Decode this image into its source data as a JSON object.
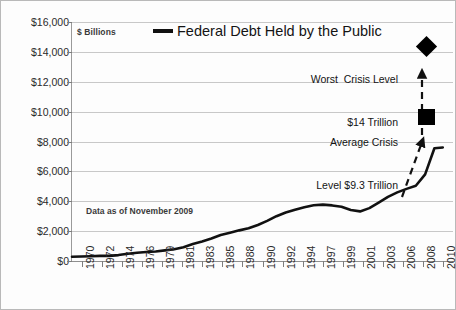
{
  "chart_data": {
    "type": "line",
    "title": "Federal Debt Held by the Public",
    "units_label": "$ Billions",
    "note": "Data as of November 2009",
    "xlabel": "",
    "ylabel": "",
    "ylim": [
      0,
      16000
    ],
    "xlim": [
      1970,
      2011
    ],
    "grid": true,
    "legend_position": "top-center",
    "ytick_labels": [
      "$0",
      "$2,000",
      "$4,000",
      "$6,000",
      "$8,000",
      "$10,000",
      "$12,000",
      "$14,000",
      "$16,000"
    ],
    "ytick_values": [
      0,
      2000,
      4000,
      6000,
      8000,
      10000,
      12000,
      14000,
      16000
    ],
    "xtick_labels": [
      "1970",
      "1972",
      "1974",
      "1976",
      "1979",
      "1981",
      "1983",
      "1985",
      "1988",
      "1990",
      "1992",
      "1994",
      "1997",
      "1999",
      "2001",
      "2003",
      "2006",
      "2008",
      "2010"
    ],
    "series": [
      {
        "name": "Federal Debt Held by the Public",
        "color": "#111111",
        "x": [
          1970,
          1971,
          1972,
          1973,
          1974,
          1975,
          1976,
          1977,
          1978,
          1979,
          1980,
          1981,
          1982,
          1983,
          1984,
          1985,
          1986,
          1987,
          1988,
          1989,
          1990,
          1991,
          1992,
          1993,
          1994,
          1995,
          1996,
          1997,
          1998,
          1999,
          2000,
          2001,
          2002,
          2003,
          2004,
          2005,
          2006,
          2007,
          2008,
          2009,
          2009.9
        ],
        "values": [
          283,
          303,
          322,
          343,
          346,
          396,
          480,
          551,
          607,
          640,
          712,
          789,
          925,
          1137,
          1307,
          1507,
          1741,
          1890,
          2051,
          2190,
          2412,
          2689,
          2999,
          3248,
          3433,
          3604,
          3734,
          3772,
          3721,
          3632,
          3410,
          3320,
          3540,
          3913,
          4296,
          4592,
          4829,
          5035,
          5803,
          7552,
          7600
        ]
      }
    ],
    "annotations": [
      {
        "name": "worst-crisis",
        "text_line1": "Worst  Crisis Level",
        "text_line2": "$14 Trillion",
        "marker": "diamond",
        "marker_value": 14000,
        "marker_x": 2010
      },
      {
        "name": "average-crisis",
        "text_line1": "Average Crisis",
        "text_line2": "Level $9.3 Trillion",
        "marker": "square",
        "marker_value": 9300,
        "marker_x": 2010
      }
    ]
  }
}
